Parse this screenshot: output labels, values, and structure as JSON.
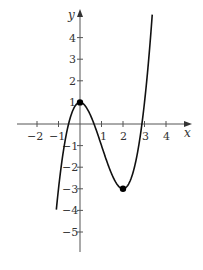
{
  "chart_data": {
    "type": "line",
    "title": "",
    "xlabel": "x",
    "ylabel": "y",
    "function": "x^3 - 3x^2 + 1",
    "xlim": [
      -2.9,
      4.7
    ],
    "ylim": [
      -6,
      5
    ],
    "x_ticks": [
      -2,
      -1,
      1,
      2,
      3,
      4
    ],
    "x_tick_labels": [
      "−2",
      "−1",
      "1",
      "2",
      "3",
      "4"
    ],
    "y_ticks": [
      -5,
      -4,
      -3,
      -2,
      -1,
      1,
      2,
      3,
      4
    ],
    "y_tick_labels": [
      "−5",
      "−4",
      "−3",
      "−2",
      "−1",
      "1",
      "2",
      "3",
      "4"
    ],
    "grid": false,
    "legend": null,
    "series": [
      {
        "name": "f(x)",
        "x": [
          -1.1,
          -1,
          -0.5,
          0,
          0.5,
          1,
          1.5,
          2,
          2.5,
          3,
          3.3,
          3.45
        ],
        "y": [
          -5.96,
          -3,
          -0.375,
          1,
          0.375,
          -1,
          -2.375,
          -3,
          -2.125,
          1,
          4.27,
          6.35
        ]
      }
    ],
    "marked_points": [
      {
        "label": "local maximum",
        "x": 0,
        "y": 1
      },
      {
        "label": "local minimum",
        "x": 2,
        "y": -3
      }
    ],
    "colors": {
      "axis": "#555555",
      "curve": "#111111",
      "points": "#000000"
    }
  }
}
